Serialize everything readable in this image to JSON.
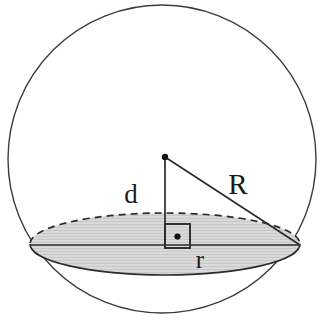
{
  "figure": {
    "background_color": "#ffffff",
    "width": 335,
    "height": 327
  },
  "labels": {
    "radius_sphere": "R",
    "distance_center_to_plane": "d",
    "radius_cross_section": "r"
  },
  "geometry": {
    "sphere_outline": {
      "name": "great circle outline",
      "cx": 162,
      "cy": 159,
      "r": 154,
      "stroke": "#3c3c3c",
      "stroke_width": 1.4,
      "fill": "none"
    },
    "cross_section_ellipse": {
      "name": "shaded circular cross-section (seen in perspective)",
      "cx": 165,
      "cy": 244,
      "rx": 135,
      "ry": 31,
      "fill": "#d9d9d9",
      "stroke_front": "#2b2b2b",
      "stroke_back": "#2b2b2b",
      "back_dash": "7,5"
    },
    "center_point": {
      "name": "sphere center",
      "cx": 165,
      "cy": 157,
      "r": 3.2,
      "fill": "#111111"
    },
    "segment_d": {
      "name": "perpendicular from center to plane",
      "x1": 165,
      "y1": 157,
      "x2": 165,
      "y2": 246,
      "stroke": "#2b2b2b"
    },
    "segment_R": {
      "name": "radius to rim of cross-section",
      "x1": 165,
      "y1": 157,
      "x2": 300,
      "y2": 245,
      "stroke": "#2b2b2b"
    },
    "segment_r": {
      "name": "chord across cross-section (diameter in view)",
      "x1": 31,
      "y1": 245,
      "x2": 300,
      "y2": 245,
      "stroke": "#2b2b2b"
    },
    "right_angle_marker": {
      "name": "right angle square with interior dot",
      "x": 165,
      "y": 224,
      "size": 25,
      "stroke": "#2b2b2b",
      "dot_r": 3.1,
      "dot_fill": "#111111"
    }
  },
  "label_positions": {
    "R": {
      "x": 238,
      "y": 194
    },
    "d": {
      "x": 131,
      "y": 203
    },
    "r": {
      "x": 200,
      "y": 268
    }
  },
  "colors": {
    "ink": "#2b2b2b",
    "outline": "#3c3c3c",
    "shade": "#d9d9d9",
    "hatch": "#c4c4c4",
    "dot": "#111111",
    "paper": "#ffffff"
  }
}
